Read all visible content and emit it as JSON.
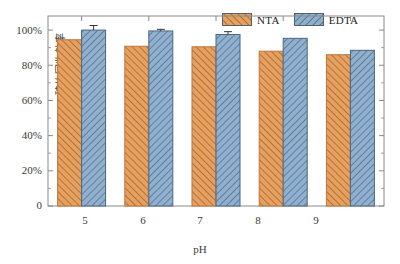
{
  "chart_data": {
    "type": "bar",
    "title": "",
    "subtitle": "",
    "xlabel": "pH",
    "ylabel": "硫的回收效率",
    "categories": [
      "5",
      "6",
      "7",
      "8",
      "9"
    ],
    "series": [
      {
        "name": "NTA",
        "color": "#e8a05c",
        "edge_color": "#c4763a",
        "hatch": "forward-slash",
        "values": [
          94.5,
          90.8,
          90.5,
          88.0,
          86.0
        ],
        "errors": [
          0,
          0,
          0,
          0,
          0
        ]
      },
      {
        "name": "EDTA",
        "color": "#8fb0cf",
        "edge_color": "#4a6781",
        "hatch": "back-slash",
        "values": [
          100.0,
          99.5,
          97.5,
          95.3,
          88.5
        ],
        "errors": [
          2.6,
          0.9,
          1.6,
          0,
          0
        ]
      }
    ],
    "ylim": [
      0,
      108
    ],
    "ytick_values": [
      0,
      20,
      40,
      60,
      80,
      100
    ],
    "ytick_labels": [
      "0",
      "20%",
      "40%",
      "60%",
      "80%",
      "100%"
    ],
    "xtick_labels": [
      "5",
      "6",
      "7",
      "8",
      "9"
    ],
    "grid": false,
    "legend_position": "top-right",
    "legend_entries": [
      "NTA",
      "EDTA"
    ],
    "frame": "box",
    "bar_count_per_group": 2
  },
  "axes": {
    "y_title": "硫的回收效率",
    "x_title": "pH"
  },
  "legend": {
    "items": [
      {
        "label": "NTA"
      },
      {
        "label": "EDTA"
      }
    ]
  },
  "colors": {
    "nta_fill": "#e8a05c",
    "nta_edge": "#c0743a",
    "edta_fill": "#8fb0cf",
    "edta_edge": "#4a6781",
    "axis": "#8a8a8a",
    "text": "#3b3b3b",
    "background": "#ffffff"
  }
}
